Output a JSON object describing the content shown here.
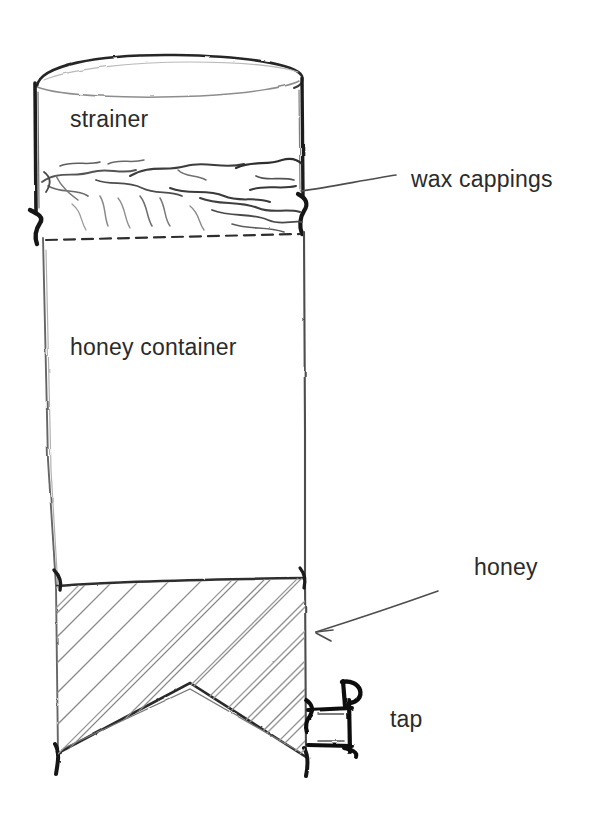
{
  "figure": {
    "kind": "hand-drawn-sketch",
    "background_color": "#ffffff",
    "ink_color": "#3a3a3a",
    "label_color": "#2b2b2b"
  },
  "labels": {
    "strainer": "strainer",
    "wax_cappings": "wax cappings",
    "honey_container": "honey container",
    "honey": "honey",
    "tap": "tap"
  },
  "parts": [
    {
      "name": "strainer",
      "description": "open cylindrical vessel at the top of the stack"
    },
    {
      "name": "wax-cappings",
      "description": "tangled mass of wax resting in the strainer"
    },
    {
      "name": "honey-container",
      "description": "tall cylindrical vessel below the strainer"
    },
    {
      "name": "honey",
      "description": "hatched liquid filling the lower part of the container"
    },
    {
      "name": "tap",
      "description": "valve on the lower right wall of the honey container"
    }
  ],
  "leaders": [
    {
      "from": "wax-cappings-label",
      "to": "strainer-right-wall",
      "style": "plain-line"
    },
    {
      "from": "honey-label",
      "to": "container-right-wall",
      "style": "arrow"
    }
  ]
}
